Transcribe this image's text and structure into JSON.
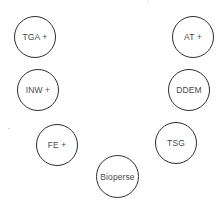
{
  "diagram": {
    "type": "circle-node-arc",
    "nodes": [
      {
        "id": "tga",
        "label": "TGA +",
        "cx": 35,
        "cy": 37
      },
      {
        "id": "at",
        "label": "AT +",
        "cx": 193,
        "cy": 37
      },
      {
        "id": "inw",
        "label": "INW +",
        "cx": 38,
        "cy": 90
      },
      {
        "id": "ddem",
        "label": "DDEM",
        "cx": 189,
        "cy": 90
      },
      {
        "id": "fe",
        "label": "FE +",
        "cx": 57,
        "cy": 145
      },
      {
        "id": "tsg",
        "label": "TSG",
        "cx": 176,
        "cy": 143
      },
      {
        "id": "bioperse",
        "label": "Bioperse",
        "cx": 117,
        "cy": 176
      }
    ],
    "colors": {
      "background": "#ffffff",
      "stroke": "#2f2f2f",
      "text": "#4a4a4a"
    }
  }
}
